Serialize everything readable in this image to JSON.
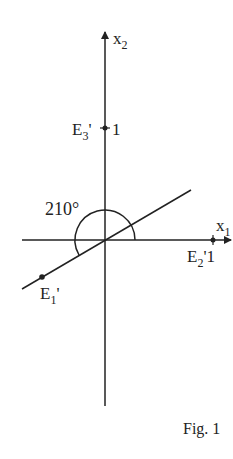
{
  "figure": {
    "caption": "Fig. 1",
    "axes": {
      "x1": {
        "label": "x",
        "subscript": "1"
      },
      "x2": {
        "label": "x",
        "subscript": "2"
      }
    },
    "angle_label": "210°",
    "points": {
      "E1": {
        "label": "E",
        "subscript": "1",
        "prime": "'"
      },
      "E2": {
        "label": "E",
        "subscript": "2",
        "prime": "'",
        "value": "1"
      },
      "E3": {
        "label": "E",
        "subscript": "3",
        "prime": "'",
        "value": "1"
      }
    },
    "colors": {
      "stroke": "#222222",
      "background": "#ffffff"
    }
  }
}
